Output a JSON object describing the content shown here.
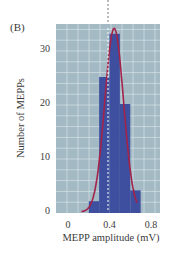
{
  "panel_label": "(B)",
  "colors": {
    "plot_background": "#a3b9c3",
    "grid": "#d6e2e7",
    "bars": "#3d4f9e",
    "fit_curve": "#a3234a",
    "mean_line": "#ffffff",
    "top_dashed_line": "#555555"
  },
  "chart_data": {
    "type": "bar",
    "title": "",
    "xlabel": "MEPP amplitude (mV)",
    "ylabel": "Number of MEPPs",
    "x_ticks": [
      "0",
      "0.4",
      "0.8"
    ],
    "y_ticks": [
      "0",
      "10",
      "20",
      "30"
    ],
    "xlim": [
      -0.1,
      0.9
    ],
    "ylim": [
      0,
      35
    ],
    "grid": true,
    "legend": null,
    "bins": [
      {
        "x0": 0.2,
        "x1": 0.3,
        "count": 2
      },
      {
        "x0": 0.3,
        "x1": 0.4,
        "count": 25
      },
      {
        "x0": 0.4,
        "x1": 0.5,
        "count": 33
      },
      {
        "x0": 0.5,
        "x1": 0.6,
        "count": 20
      },
      {
        "x0": 0.6,
        "x1": 0.7,
        "count": 4
      }
    ],
    "categories": [
      "0.2-0.3",
      "0.3-0.4",
      "0.4-0.5",
      "0.5-0.6",
      "0.6-0.7"
    ],
    "values": [
      2,
      25,
      33,
      20,
      4
    ],
    "overlays": [
      {
        "type": "gaussian_fit",
        "mean": 0.4,
        "peak": 34,
        "sd": 0.09,
        "color": "#a3234a"
      },
      {
        "type": "vertical_dashed_line",
        "x": 0.4,
        "label": "mean"
      }
    ]
  }
}
